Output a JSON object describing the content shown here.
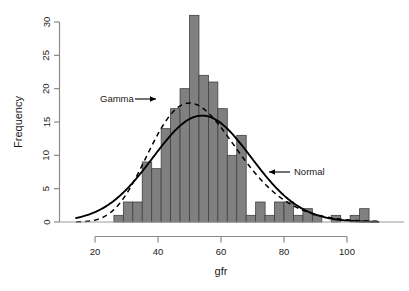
{
  "chart_data": {
    "type": "bar",
    "title": "",
    "subtitle": "",
    "xlabel": "gfr",
    "ylabel": "Frequency",
    "xlim": [
      14,
      110
    ],
    "ylim": [
      0,
      31.5
    ],
    "x_ticks": [
      20,
      40,
      60,
      80,
      100
    ],
    "y_ticks": [
      0,
      5,
      10,
      15,
      20,
      25,
      30
    ],
    "grid": false,
    "legend_position": "inline-annotations",
    "bin_width": 3,
    "bar_color": "#808080",
    "bar_edge_color": "#404040",
    "histogram": {
      "bin_starts": [
        26,
        29,
        32,
        35,
        38,
        41,
        44,
        47,
        50,
        53,
        56,
        59,
        62,
        65,
        68,
        71,
        74,
        77,
        80,
        83,
        86,
        89,
        92,
        95,
        98,
        101,
        104
      ],
      "bin_ends": [
        29,
        32,
        35,
        38,
        41,
        44,
        47,
        50,
        53,
        56,
        59,
        62,
        65,
        68,
        71,
        74,
        77,
        80,
        83,
        86,
        89,
        92,
        95,
        98,
        101,
        104,
        107
      ],
      "values": [
        1,
        3,
        3,
        9,
        8,
        14,
        17,
        20,
        31,
        22,
        21,
        17,
        10,
        13,
        1,
        3,
        1,
        3,
        3,
        1,
        2,
        1,
        0,
        1,
        0,
        1,
        2
      ]
    },
    "series": [
      {
        "name": "Gamma",
        "style": "dashed",
        "color": "#000000",
        "annotation": "Gamma",
        "annotation_x": 41,
        "annotation_y": 19,
        "peak_x": 49,
        "peak_y": 21.3,
        "shape": 14.0,
        "rate": 0.26
      },
      {
        "name": "Normal",
        "style": "solid",
        "color": "#000000",
        "annotation": "Normal",
        "annotation_x": 82,
        "annotation_y": 7.5,
        "peak_x": 54,
        "peak_y": 19.2,
        "mean": 54.0,
        "sd": 15.6
      }
    ],
    "annotations": [
      {
        "text": "Gamma",
        "x": 41,
        "y": 19,
        "arrow_to_x": 46.5,
        "arrow_to_y": 19
      },
      {
        "text": "Normal",
        "x": 82,
        "y": 7.5,
        "arrow_to_x": 75.5,
        "arrow_to_y": 7.5
      }
    ]
  },
  "axes": {
    "y_label": "Frequency",
    "x_label": "gfr",
    "y_tick_labels": [
      "0",
      "5",
      "10",
      "15",
      "20",
      "25",
      "30"
    ],
    "x_tick_labels": [
      "20",
      "40",
      "60",
      "80",
      "100"
    ]
  },
  "annotations": {
    "gamma_label": "Gamma",
    "normal_label": "Normal"
  }
}
